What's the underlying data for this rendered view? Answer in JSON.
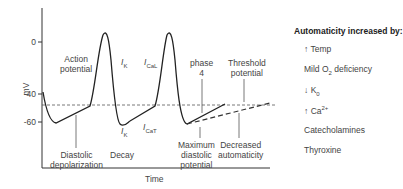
{
  "diagram": {
    "y_axis_label": "mV",
    "x_axis_label": "Time",
    "y_ticks": [
      "0",
      "-40",
      "-60"
    ],
    "labels": {
      "action_potential": [
        "Action",
        "potential"
      ],
      "diastolic_depolarization": [
        "Diastolic",
        "depolarization"
      ],
      "decay": "Decay",
      "maximum_diastolic_potential": [
        "Maximum",
        "diastolic",
        "potential"
      ],
      "decreased_automaticity": [
        "Decreased",
        "automaticity"
      ],
      "threshold_potential": [
        "Threshold",
        "potential"
      ],
      "phase4": [
        "phase",
        "4"
      ]
    },
    "currents": {
      "ik_top": {
        "base": "I",
        "sub": "K"
      },
      "ical": {
        "base": "I",
        "sub": "CaL"
      },
      "ik_bottom": {
        "base": "I",
        "sub": "K"
      },
      "icat": {
        "base": "I",
        "sub": "CaT"
      }
    }
  },
  "sidebar": {
    "title": "Automaticity increased by:",
    "items": [
      {
        "prefix": "↑",
        "text": "Temp"
      },
      {
        "prefix": "",
        "text": "Mild O",
        "sub": "2",
        "rest": " deficiency"
      },
      {
        "prefix": "↓",
        "text": "K",
        "sub": "0"
      },
      {
        "prefix": "↑",
        "text": "Ca",
        "sup": "2+"
      },
      {
        "prefix": "",
        "text": "Catecholamines"
      },
      {
        "prefix": "",
        "text": "Thyroxine"
      }
    ]
  }
}
